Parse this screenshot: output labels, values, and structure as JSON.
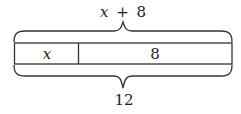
{
  "diagram": {
    "type": "tape-diagram",
    "top_brace_label": "x + 8",
    "top_brace_label_parts": {
      "var": "x",
      "op": "+",
      "num": "8"
    },
    "bottom_brace_label": "12",
    "segments": [
      {
        "label": "x",
        "italic": true
      },
      {
        "label": "8",
        "italic": false
      }
    ],
    "colors": {
      "stroke": "#333333",
      "background": "#ffffff"
    }
  }
}
